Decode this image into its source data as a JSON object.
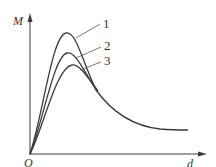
{
  "diagram": {
    "type": "curve-family",
    "axes": {
      "y_label": "M",
      "x_label": "d",
      "origin_label": "O"
    },
    "curves": [
      {
        "id": "1",
        "label": "1",
        "relative_peak": "highest"
      },
      {
        "id": "2",
        "label": "2",
        "relative_peak": "middle"
      },
      {
        "id": "3",
        "label": "3",
        "relative_peak": "lowest"
      }
    ],
    "colors": {
      "line": "#3a3a3a",
      "text": "#333333",
      "background": "#ffffff"
    }
  }
}
